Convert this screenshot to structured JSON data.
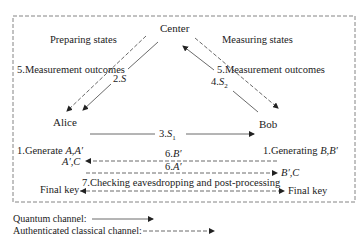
{
  "nodes": {
    "center": "Center",
    "alice": "Alice",
    "bob": "Bob"
  },
  "regions": {
    "left": "Preparing states",
    "right": "Measuring states"
  },
  "edges": {
    "left_measure": "5.Measurement outcomes",
    "left_s_prefix": "2.",
    "left_s_var": "S",
    "right_measure": "5.Measurement outcomes",
    "right_s_prefix": "4.",
    "right_s_var": "S",
    "right_s_sub": "2",
    "s1_prefix": "3.",
    "s1_var": "S",
    "s1_sub": "1",
    "b_prime_prefix": "6.",
    "b_prime_var": "B′",
    "a_prime_prefix": "6.",
    "a_prime_var": "A′",
    "checking": "7.Checking eavesdropping and post-processing"
  },
  "steps": {
    "alice_gen_prefix": "1.Generate ",
    "alice_gen_vars": "A,A′",
    "alice_recv": "A′,C",
    "bob_gen_prefix": "1.Generating ",
    "bob_gen_vars": "B,B′",
    "bob_recv": "B′,C",
    "alice_final": "Final key",
    "bob_final": "Final key"
  },
  "legend": {
    "quantum": "Quantum channel:",
    "classical": "Authenticated classical channel:"
  }
}
